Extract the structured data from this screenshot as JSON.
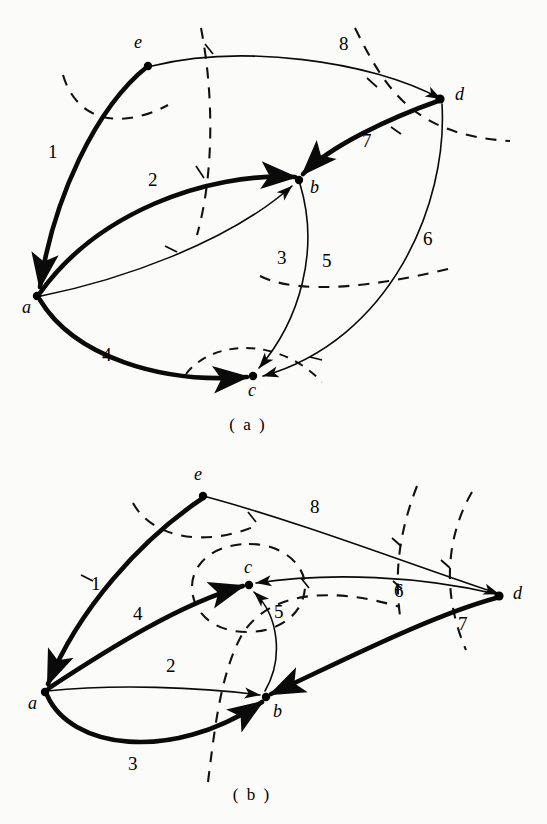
{
  "figure": {
    "width": 547,
    "height": 824,
    "background_color": "#fbfbfa",
    "ink_color": "#0a0a0a"
  },
  "panels": [
    {
      "id": "a",
      "caption": "( a )",
      "caption_pos": {
        "x": 248,
        "y": 430
      },
      "nodes": [
        {
          "id": "a",
          "label": "a",
          "x": 37,
          "y": 296,
          "label_x": 22,
          "label_y": 313
        },
        {
          "id": "b",
          "label": "b",
          "x": 299,
          "y": 180,
          "label_x": 310,
          "label_y": 193
        },
        {
          "id": "c",
          "label": "c",
          "x": 253,
          "y": 376,
          "label_x": 248,
          "label_y": 396
        },
        {
          "id": "d",
          "label": "d",
          "x": 440,
          "y": 99,
          "label_x": 455,
          "label_y": 100
        },
        {
          "id": "e",
          "label": "e",
          "x": 148,
          "y": 66,
          "label_x": 134,
          "label_y": 48
        }
      ],
      "edges": [
        {
          "label": "1",
          "from": "e",
          "to": "a",
          "weight": "thick",
          "label_x": 48,
          "label_y": 158
        },
        {
          "label": "2",
          "from": "a",
          "to": "b",
          "weight": "thick",
          "label_x": 148,
          "label_y": 186
        },
        {
          "label": "3",
          "from": "a",
          "to": "b",
          "weight": "thin",
          "label_x": 277,
          "label_y": 264
        },
        {
          "label": "4",
          "from": "a",
          "to": "c",
          "weight": "thick",
          "label_x": 102,
          "label_y": 361
        },
        {
          "label": "5",
          "from": "b",
          "to": "c",
          "weight": "thin",
          "label_x": 322,
          "label_y": 267
        },
        {
          "label": "6",
          "from": "d",
          "to": "c",
          "weight": "thin",
          "label_x": 423,
          "label_y": 245
        },
        {
          "label": "7",
          "from": "d",
          "to": "b",
          "weight": "thick",
          "label_x": 362,
          "label_y": 147
        },
        {
          "label": "8",
          "from": "e",
          "to": "d",
          "weight": "thin",
          "label_x": 339,
          "label_y": 50
        }
      ],
      "cut_curves": 4
    },
    {
      "id": "b",
      "caption": "( b )",
      "caption_pos": {
        "x": 252,
        "y": 800
      },
      "nodes": [
        {
          "id": "a",
          "label": "a",
          "x": 45,
          "y": 692,
          "label_x": 28,
          "label_y": 709
        },
        {
          "id": "b",
          "label": "b",
          "x": 266,
          "y": 697,
          "label_x": 273,
          "label_y": 717
        },
        {
          "id": "c",
          "label": "c",
          "x": 249,
          "y": 585,
          "label_x": 247,
          "label_y": 573
        },
        {
          "id": "d",
          "label": "d",
          "x": 499,
          "y": 596,
          "label_x": 513,
          "label_y": 599
        },
        {
          "id": "e",
          "label": "e",
          "x": 203,
          "y": 496,
          "label_x": 194,
          "label_y": 480
        }
      ],
      "edges": [
        {
          "label": "1",
          "from": "e",
          "to": "a",
          "weight": "thick",
          "label_x": 91,
          "label_y": 590
        },
        {
          "label": "2",
          "from": "a",
          "to": "b",
          "weight": "thin",
          "label_x": 166,
          "label_y": 672
        },
        {
          "label": "3",
          "from": "a",
          "to": "b",
          "weight": "thick",
          "label_x": 128,
          "label_y": 770
        },
        {
          "label": "4",
          "from": "a",
          "to": "c",
          "weight": "thick",
          "label_x": 133,
          "label_y": 620
        },
        {
          "label": "5",
          "from": "b",
          "to": "c",
          "weight": "thin",
          "label_x": 274,
          "label_y": 618
        },
        {
          "label": "6",
          "from": "d",
          "to": "c",
          "weight": "thin",
          "label_x": 394,
          "label_y": 597
        },
        {
          "label": "7",
          "from": "d",
          "to": "b",
          "weight": "thick",
          "label_x": 458,
          "label_y": 630
        },
        {
          "label": "8",
          "from": "e",
          "to": "d",
          "weight": "thin",
          "label_x": 310,
          "label_y": 513
        }
      ],
      "cut_curves": 4
    }
  ]
}
